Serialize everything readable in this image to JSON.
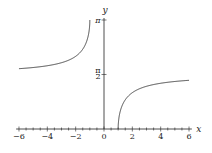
{
  "chart_data": {
    "type": "line",
    "title": "",
    "function": "y = arcsec(x)",
    "xlabel": "x",
    "ylabel": "y",
    "xlim": [
      -6,
      6
    ],
    "ylim": [
      0,
      3.14159
    ],
    "x_ticks": [
      -6,
      -4,
      -2,
      0,
      2,
      4,
      6
    ],
    "x_tick_labels": [
      "−6",
      "−4",
      "−2",
      "0",
      "2",
      "4",
      "6"
    ],
    "y_ticks": [
      1.5708,
      3.14159
    ],
    "y_tick_labels": [
      "π/2",
      "π"
    ],
    "grid": false,
    "legend": null,
    "series": [
      {
        "name": "left branch (x ≤ −1)",
        "x": [
          -6,
          -5,
          -4,
          -3,
          -2,
          -1.5,
          -1.2,
          -1.05,
          -1
        ],
        "values": [
          1.7382,
          1.7722,
          1.8235,
          1.9106,
          2.0944,
          2.3005,
          2.5559,
          2.8309,
          3.14159
        ]
      },
      {
        "name": "right branch (x ≥ 1)",
        "x": [
          1,
          1.05,
          1.2,
          1.5,
          2,
          3,
          4,
          5,
          6
        ],
        "values": [
          0,
          0.3107,
          0.5857,
          0.8411,
          1.0472,
          1.231,
          1.3181,
          1.3694,
          1.4033
        ]
      }
    ]
  },
  "colors": {
    "curve": "#333333",
    "axis": "#222222",
    "background": "#ffffff"
  }
}
